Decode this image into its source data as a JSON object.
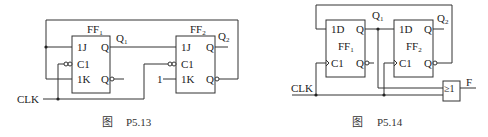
{
  "figures": [
    {
      "id": "P5.13",
      "caption_prefix": "图",
      "caption": "P5.13",
      "input_label": "CLK",
      "constant_label": "1",
      "flipflops": [
        {
          "name": "FF",
          "sub": "1",
          "pins": [
            "1J",
            "C1",
            "1K"
          ],
          "outputs": [
            "Q",
            "Q"
          ],
          "out_label": "Q",
          "out_sub": "1",
          "type": "JK",
          "clock": "negative-edge"
        },
        {
          "name": "FF",
          "sub": "2",
          "pins": [
            "1J",
            "C1",
            "1K"
          ],
          "outputs": [
            "Q",
            "Q"
          ],
          "out_label": "Q",
          "out_sub": "2",
          "type": "JK",
          "clock": "negative-edge"
        }
      ]
    },
    {
      "id": "P5.14",
      "caption_prefix": "图",
      "caption": "P5.14",
      "input_label": "CLK",
      "output_label": "F",
      "gate_label": "≥1",
      "flipflops": [
        {
          "name": "FF",
          "sub": "1",
          "pins": [
            "1D",
            "C1"
          ],
          "outputs": [
            "Q",
            "Q"
          ],
          "out_label": "Q",
          "out_sub": "1",
          "type": "D",
          "clock": "positive-edge"
        },
        {
          "name": "FF",
          "sub": "2",
          "pins": [
            "1D",
            "C1"
          ],
          "outputs": [
            "Q",
            "Q"
          ],
          "out_label": "Q",
          "out_sub": "2",
          "type": "D",
          "clock": "positive-edge"
        }
      ]
    }
  ]
}
